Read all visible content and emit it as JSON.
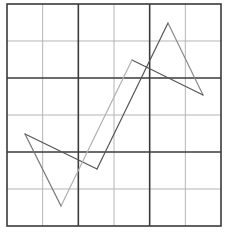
{
  "diagram": {
    "type": "grid-figure",
    "grid": {
      "left": 7,
      "top": 4,
      "right": 221,
      "bottom": 226,
      "cols": 6,
      "rows": 6,
      "thick_every": 2,
      "thin_color": "#b5b5b5",
      "thick_color": "#3a3a3a",
      "border_color": "#3a3a3a"
    },
    "shape": {
      "name": "zigzag-hexagon",
      "vertices": [
        [
          25,
          134
        ],
        [
          97,
          169
        ],
        [
          168,
          23
        ],
        [
          203,
          95
        ],
        [
          132,
          60
        ],
        [
          61,
          206
        ]
      ],
      "segments": [
        {
          "from": [
            25,
            134
          ],
          "to": [
            97,
            169
          ],
          "color": "#555555"
        },
        {
          "from": [
            97,
            169
          ],
          "to": [
            168,
            23
          ],
          "color": "#555555"
        },
        {
          "from": [
            168,
            23
          ],
          "to": [
            203,
            95
          ],
          "color": "#8a8a8a"
        },
        {
          "from": [
            203,
            95
          ],
          "to": [
            132,
            60
          ],
          "color": "#555555"
        },
        {
          "from": [
            132,
            60
          ],
          "to": [
            61,
            206
          ],
          "color": "#b0b0b0"
        },
        {
          "from": [
            61,
            206
          ],
          "to": [
            25,
            134
          ],
          "color": "#777777"
        }
      ]
    }
  }
}
